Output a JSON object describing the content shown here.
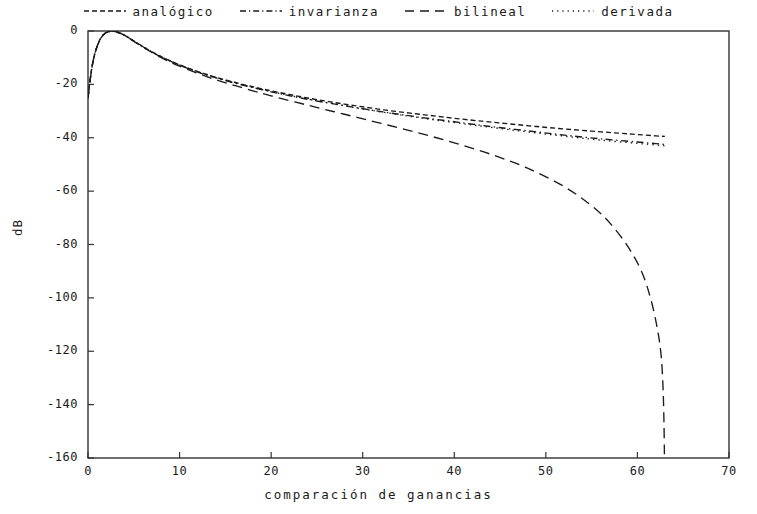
{
  "chart_data": {
    "type": "line",
    "title": "",
    "xlabel": "comparación de ganancias",
    "ylabel": "dB",
    "xlim": [
      0,
      70
    ],
    "ylim": [
      -160,
      0
    ],
    "xticks": [
      0,
      10,
      20,
      30,
      40,
      50,
      60,
      70
    ],
    "yticks": [
      0,
      -20,
      -40,
      -60,
      -80,
      -100,
      -120,
      -140,
      -160
    ],
    "xticklabels": [
      "0",
      "10",
      "20",
      "30",
      "40",
      "50",
      "60",
      "70"
    ],
    "yticklabels": [
      "0",
      "-20",
      "-40",
      "-60",
      "-80",
      "-100",
      "-120",
      "-140",
      "-160"
    ],
    "grid": false,
    "legend_position": "above-top-center",
    "frame": "box",
    "series": [
      {
        "name": "analógico",
        "style": "dashed",
        "color": "#1a1a1a",
        "x": [
          0,
          0.3,
          0.6,
          1,
          1.4,
          1.8,
          2.2,
          2.6,
          3,
          3.6,
          4.2,
          5,
          6,
          7,
          8,
          9,
          10,
          11,
          12,
          13,
          14,
          15,
          16,
          17,
          18,
          19,
          20,
          22,
          24,
          26,
          28,
          30,
          32,
          34,
          36,
          38,
          40,
          43,
          46,
          49,
          52,
          55,
          58,
          60,
          62,
          63
        ],
        "y": [
          -25.0,
          -16.5,
          -10.5,
          -5.6,
          -2.6,
          -1.0,
          -0.25,
          -0.05,
          -0.2,
          -0.9,
          -2.0,
          -3.7,
          -5.8,
          -7.8,
          -9.6,
          -11.2,
          -12.7,
          -14.0,
          -15.2,
          -16.3,
          -17.4,
          -18.3,
          -19.2,
          -20.1,
          -20.9,
          -21.7,
          -22.4,
          -23.8,
          -25.1,
          -26.3,
          -27.4,
          -28.4,
          -29.4,
          -30.3,
          -31.1,
          -31.9,
          -32.7,
          -33.8,
          -34.8,
          -35.8,
          -36.7,
          -37.5,
          -38.3,
          -38.8,
          -39.3,
          -39.5
        ]
      },
      {
        "name": "invarianza",
        "style": "dashdot",
        "color": "#1a1a1a",
        "x": [
          0,
          0.3,
          0.6,
          1,
          1.4,
          1.8,
          2.2,
          2.6,
          3,
          3.6,
          4.2,
          5,
          6,
          7,
          8,
          9,
          10,
          12,
          14,
          16,
          18,
          20,
          24,
          28,
          32,
          36,
          40,
          44,
          48,
          52,
          56,
          60,
          62,
          63
        ],
        "y": [
          -25.2,
          -16.6,
          -10.6,
          -5.7,
          -2.7,
          -1.05,
          -0.3,
          -0.08,
          -0.22,
          -0.95,
          -2.05,
          -3.8,
          -5.9,
          -7.9,
          -9.7,
          -11.3,
          -12.8,
          -15.4,
          -17.6,
          -19.5,
          -21.2,
          -22.8,
          -25.6,
          -28.0,
          -30.2,
          -32.2,
          -34.0,
          -35.8,
          -37.4,
          -39.0,
          -40.4,
          -41.6,
          -42.2,
          -42.5
        ]
      },
      {
        "name": "bilineal",
        "style": "longdash",
        "color": "#1a1a1a",
        "x": [
          0,
          0.3,
          0.6,
          1,
          1.4,
          1.8,
          2.2,
          2.6,
          3,
          3.6,
          4.2,
          5,
          6,
          7,
          8,
          9,
          10,
          12,
          14,
          16,
          18,
          20,
          24,
          28,
          32,
          36,
          40,
          44,
          48,
          52,
          55,
          57,
          59,
          60.5,
          61.5,
          62.2,
          62.6,
          62.8,
          62.9,
          62.95
        ],
        "y": [
          -25.2,
          -16.7,
          -10.7,
          -5.8,
          -2.8,
          -1.1,
          -0.35,
          -0.12,
          -0.28,
          -1.0,
          -2.1,
          -3.9,
          -6.1,
          -8.1,
          -10.0,
          -11.7,
          -13.2,
          -15.9,
          -18.3,
          -20.4,
          -22.4,
          -24.3,
          -27.8,
          -31.2,
          -34.6,
          -38.1,
          -41.9,
          -46.2,
          -51.4,
          -58.3,
          -65.5,
          -72.0,
          -81.0,
          -90.5,
          -101.0,
          -112.0,
          -122.0,
          -134.0,
          -147.0,
          -160.0
        ]
      },
      {
        "name": "derivada",
        "style": "dotted",
        "color": "#1a1a1a",
        "x": [
          0,
          0.3,
          0.6,
          1,
          1.4,
          1.8,
          2.2,
          2.6,
          3,
          3.6,
          4.2,
          5,
          6,
          7,
          8,
          9,
          10,
          12,
          14,
          16,
          18,
          20,
          24,
          28,
          32,
          36,
          40,
          44,
          48,
          52,
          56,
          60,
          62,
          63
        ],
        "y": [
          -25.1,
          -16.5,
          -10.5,
          -5.6,
          -2.6,
          -1.0,
          -0.25,
          -0.05,
          -0.2,
          -0.9,
          -2.0,
          -3.75,
          -5.85,
          -7.85,
          -9.65,
          -11.25,
          -12.75,
          -15.3,
          -17.5,
          -19.4,
          -21.1,
          -22.7,
          -25.5,
          -28.0,
          -30.3,
          -32.4,
          -34.3,
          -36.1,
          -37.8,
          -39.4,
          -40.9,
          -42.1,
          -42.7,
          -43.0
        ]
      }
    ]
  },
  "legend": {
    "items": [
      {
        "label": "analógico",
        "style": "dashed"
      },
      {
        "label": "invarianza",
        "style": "dashdot"
      },
      {
        "label": "bilineal",
        "style": "longdash"
      },
      {
        "label": "derivada",
        "style": "dotted"
      }
    ]
  },
  "axes": {
    "x_label": "comparación de ganancias",
    "y_label": "dB"
  }
}
